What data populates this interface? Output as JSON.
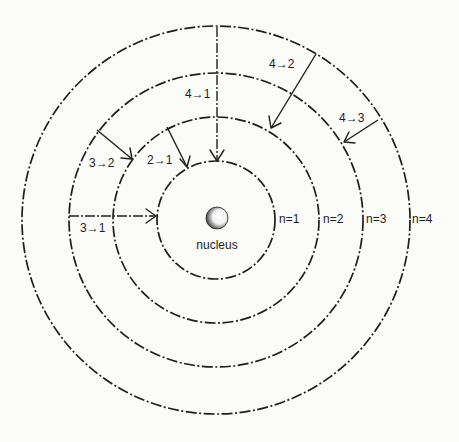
{
  "diagram": {
    "center": {
      "x": 216,
      "y": 220
    },
    "nucleus": {
      "label": "nucleus",
      "radius": 10
    },
    "orbits": [
      {
        "n": 1,
        "label": "n=1",
        "radius": 59
      },
      {
        "n": 2,
        "label": "n=2",
        "radius": 103
      },
      {
        "n": 3,
        "label": "n=3",
        "radius": 147
      },
      {
        "n": 4,
        "label": "n=4",
        "radius": 193
      }
    ],
    "transitions": [
      {
        "from": 4,
        "to": 1,
        "label": "4→1"
      },
      {
        "from": 4,
        "to": 2,
        "label": "4→2"
      },
      {
        "from": 4,
        "to": 3,
        "label": "4→3"
      },
      {
        "from": 3,
        "to": 2,
        "label": "3→2"
      },
      {
        "from": 2,
        "to": 1,
        "label": "2→1"
      },
      {
        "from": 3,
        "to": 1,
        "label": "3→1"
      }
    ],
    "colors": {
      "line": "#1e1e1e",
      "background": "#fbfbf9"
    }
  }
}
